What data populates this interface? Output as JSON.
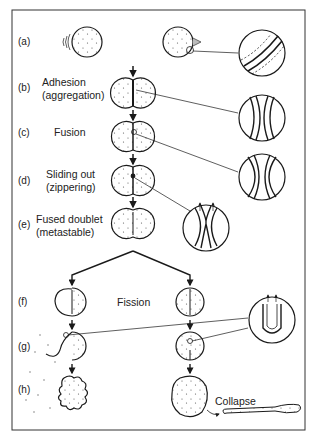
{
  "figure": {
    "type": "membrane fusion and fission stages diagram",
    "stages": [
      {
        "id": "a",
        "tag": "(a)",
        "label": "",
        "sublabel": ""
      },
      {
        "id": "b",
        "tag": "(b)",
        "label": "Adhesion",
        "sublabel": "(aggregation)"
      },
      {
        "id": "c",
        "tag": "(c)",
        "label": "Fusion",
        "sublabel": ""
      },
      {
        "id": "d",
        "tag": "(d)",
        "label": "Sliding out",
        "sublabel": "(zippering)"
      },
      {
        "id": "e",
        "tag": "(e)",
        "label": "Fused doublet",
        "sublabel": "(metastable)"
      },
      {
        "id": "f",
        "tag": "(f)",
        "label": "Fission",
        "sublabel": ""
      },
      {
        "id": "g",
        "tag": "(g)",
        "label": "",
        "sublabel": ""
      },
      {
        "id": "h",
        "tag": "(h)",
        "label": "",
        "sublabel": ""
      }
    ],
    "annotations": {
      "collapse": "Collapse"
    },
    "colors": {
      "stroke": "#1a1a1a",
      "background": "#ffffff",
      "frame": "#333333"
    }
  }
}
